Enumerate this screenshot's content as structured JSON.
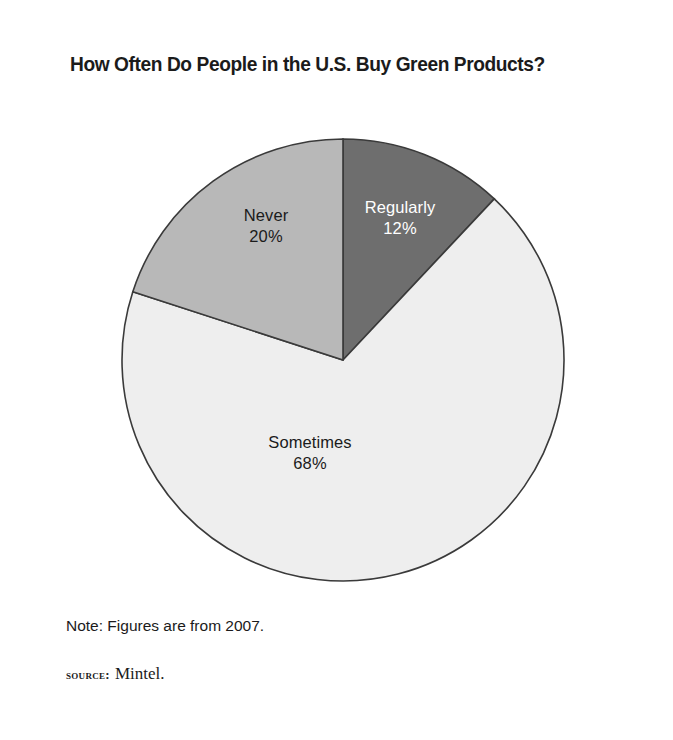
{
  "figure": {
    "title": "How Often Do People in the U.S. Buy Green Products?",
    "note": "Note: Figures are from 2007.",
    "source_label": "Source:",
    "source_value": "Mintel.",
    "frame_color": "#4a4a4a",
    "background": "#ffffff"
  },
  "chart_data": {
    "type": "pie",
    "title": "How Often Do People in the U.S. Buy Green Products?",
    "xlabel": "",
    "ylabel": "",
    "units": "percent",
    "start_angle_deg": 0,
    "direction": "clockwise",
    "total": 100,
    "categories": [
      "Regularly",
      "Sometimes",
      "Never"
    ],
    "values": [
      12,
      68,
      20
    ],
    "labels": [
      "Regularly\n12%",
      "Sometimes\n68%",
      "Never\n20%"
    ],
    "colors": [
      "#6e6e6e",
      "#eeeeee",
      "#b8b8b8"
    ],
    "slices": [
      {
        "name": "Regularly",
        "value": 12,
        "value_text": "12%",
        "color": "#6e6e6e",
        "text_color": "#ffffff",
        "start_deg": 0,
        "end_deg": 43.2,
        "label_x": 400,
        "label_y": 213
      },
      {
        "name": "Sometimes",
        "value": 68,
        "value_text": "68%",
        "color": "#eeeeee",
        "text_color": "#1b1b1b",
        "start_deg": 43.2,
        "end_deg": 288.0,
        "label_x": 310,
        "label_y": 448
      },
      {
        "name": "Never",
        "value": 20,
        "value_text": "20%",
        "color": "#b8b8b8",
        "text_color": "#1b1b1b",
        "start_deg": 288.0,
        "end_deg": 360.0,
        "label_x": 266,
        "label_y": 221
      }
    ],
    "annotations": [
      "Note: Figures are from 2007."
    ],
    "legend": "none",
    "grid": false
  }
}
